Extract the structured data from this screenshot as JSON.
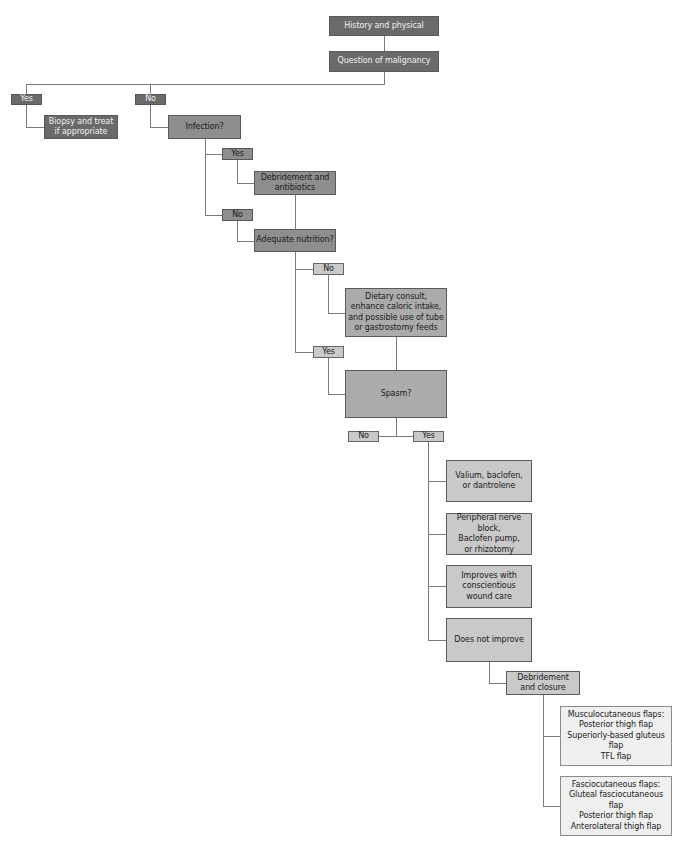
{
  "flowchart": {
    "history": "History and physical",
    "question_malignancy": "Question of malignancy",
    "malignancy_yes": "Yes",
    "malignancy_no": "No",
    "biopsy": "Biopsy and treat\nif appropriate",
    "infection": "Infection?",
    "infection_yes": "Yes",
    "debridement_antibiotics": "Debridement and\nantibiotics",
    "infection_no": "No",
    "adequate_nutrition": "Adequate nutrition?",
    "nutrition_no": "No",
    "dietary": "Dietary consult,\nenhance caloric intake,\nand possible use of tube\nor gastrostomy feeds",
    "nutrition_yes": "Yes",
    "spasm": "Spasm?",
    "spasm_no": "No",
    "spasm_yes": "Yes",
    "valium": "Valium, baclofen,\nor dantrolene",
    "peripheral": "Peripheral nerve block,\nBaclofen pump,\nor rhizotomy",
    "improves": "Improves with\nconscientious\nwound care",
    "does_not_improve": "Does not improve",
    "debridement_closure": "Debridement\nand closure",
    "musculocutaneous": "Musculocutaneous flaps:\nPosterior thigh flap\nSuperiorly-based gluteus flap\nTFL flap",
    "fasciocutaneous": "Fasciocutaneous flaps:\nGluteal fasciocutaneous flap\nPosterior thigh flap\nAnterolateral thigh flap"
  },
  "colors": {
    "dark": "#6a6a6a",
    "medium": "#8e8e8e",
    "medium_light": "#ababab",
    "light": "#c9c9c9",
    "pale": "#efefef",
    "connector": "#7a7a7a"
  }
}
